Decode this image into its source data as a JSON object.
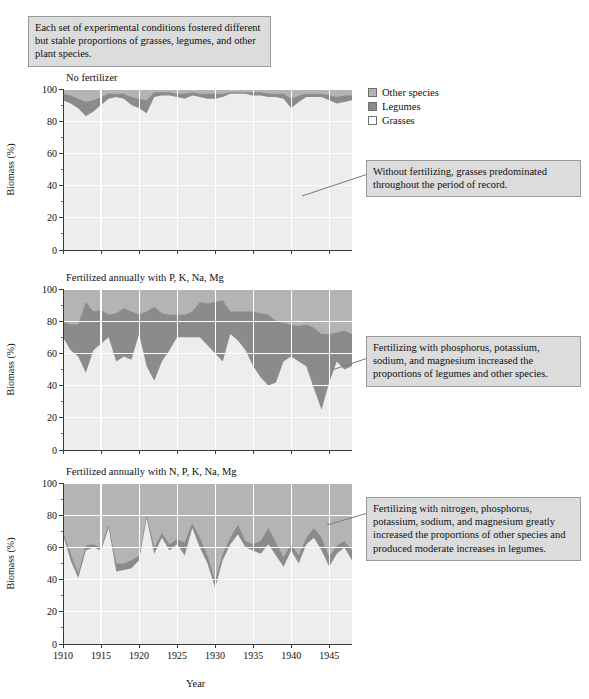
{
  "figure": {
    "axis_x_label": "Year",
    "axis_y_label": "Biomass (%)"
  },
  "legend": {
    "position": "top-right",
    "items": [
      {
        "label": "Other species",
        "color": "#b4b4b4",
        "key": "other"
      },
      {
        "label": "Legumes",
        "color": "#8b8b8b",
        "key": "legumes"
      },
      {
        "label": "Grasses",
        "color": "#ededed",
        "key": "grasses"
      }
    ]
  },
  "callouts": {
    "top": "Each set of experimental conditions fostered different but stable proportions of grasses, legumes, and other plant species.",
    "chart1": "Without fertilizing, grasses predominated throughout the period of record.",
    "chart2": "Fertilizing with phosphorus, potassium, sodium, and magnesium increased the proportions of legumes and other species.",
    "chart3": "Fertilizing with nitrogen, phosphorus, potassium, sodium, and magnesium greatly increased the proportions of other species and produced moderate increases in legumes."
  },
  "chart_data": [
    {
      "type": "area",
      "stacked": true,
      "title": "No fertilizer",
      "xlabel": "Year",
      "ylabel": "Biomass (%)",
      "xlim": [
        1910,
        1948
      ],
      "ylim": [
        0,
        100
      ],
      "ytick_major": [
        0,
        20,
        40,
        60,
        80,
        100
      ],
      "ytick_minor_step": 10,
      "xtick_major": [
        1910,
        1915,
        1920,
        1925,
        1930,
        1935,
        1940,
        1945
      ],
      "grid": true,
      "legend_order": [
        "grasses",
        "legumes",
        "other"
      ],
      "x": [
        1910,
        1911,
        1912,
        1913,
        1914,
        1915,
        1916,
        1917,
        1918,
        1919,
        1920,
        1921,
        1922,
        1923,
        1924,
        1925,
        1926,
        1927,
        1928,
        1929,
        1930,
        1931,
        1932,
        1933,
        1934,
        1935,
        1936,
        1937,
        1938,
        1939,
        1940,
        1941,
        1942,
        1943,
        1944,
        1945,
        1946,
        1947,
        1948
      ],
      "series": [
        {
          "name": "Grasses",
          "key": "grasses",
          "color": "#ededed",
          "values": [
            93,
            91,
            88,
            83,
            86,
            90,
            94,
            95,
            94,
            90,
            88,
            85,
            95,
            96,
            96,
            95,
            94,
            96,
            95,
            94,
            94,
            95,
            97,
            97,
            97,
            96,
            96,
            95,
            95,
            94,
            88,
            92,
            95,
            95,
            95,
            93,
            91,
            92,
            93
          ]
        },
        {
          "name": "Legumes",
          "key": "legumes",
          "color": "#8b8b8b",
          "values": [
            4,
            5,
            6,
            9,
            7,
            5,
            3,
            2,
            3,
            5,
            6,
            8,
            3,
            2,
            2,
            2,
            3,
            2,
            2,
            3,
            3,
            2,
            1,
            1,
            1,
            2,
            2,
            2,
            2,
            3,
            6,
            4,
            2,
            2,
            2,
            3,
            4,
            4,
            3
          ]
        },
        {
          "name": "Other species",
          "key": "other",
          "color": "#b4b4b4",
          "values": [
            3,
            4,
            6,
            8,
            7,
            5,
            3,
            3,
            3,
            5,
            6,
            7,
            2,
            2,
            2,
            3,
            3,
            2,
            3,
            3,
            3,
            3,
            2,
            2,
            2,
            2,
            2,
            3,
            3,
            3,
            6,
            4,
            3,
            3,
            3,
            4,
            5,
            4,
            4
          ]
        }
      ]
    },
    {
      "type": "area",
      "stacked": true,
      "title": "Fertilized annually with P, K, Na, Mg",
      "xlabel": "Year",
      "ylabel": "Biomass (%)",
      "xlim": [
        1910,
        1948
      ],
      "ylim": [
        0,
        100
      ],
      "ytick_major": [
        0,
        20,
        40,
        60,
        80,
        100
      ],
      "ytick_minor_step": 10,
      "xtick_major": [
        1910,
        1915,
        1920,
        1925,
        1930,
        1935,
        1940,
        1945
      ],
      "grid": true,
      "legend_order": [
        "grasses",
        "legumes",
        "other"
      ],
      "x": [
        1910,
        1911,
        1912,
        1913,
        1914,
        1915,
        1916,
        1917,
        1918,
        1919,
        1920,
        1921,
        1922,
        1923,
        1924,
        1925,
        1926,
        1927,
        1928,
        1929,
        1930,
        1931,
        1932,
        1933,
        1934,
        1935,
        1936,
        1937,
        1938,
        1939,
        1940,
        1941,
        1942,
        1943,
        1944,
        1945,
        1946,
        1947,
        1948
      ],
      "series": [
        {
          "name": "Grasses",
          "key": "grasses",
          "color": "#ededed",
          "values": [
            70,
            62,
            58,
            48,
            62,
            66,
            70,
            55,
            58,
            56,
            72,
            52,
            43,
            55,
            62,
            70,
            70,
            70,
            70,
            65,
            60,
            55,
            72,
            68,
            62,
            52,
            45,
            40,
            42,
            55,
            58,
            55,
            52,
            38,
            25,
            42,
            55,
            50,
            52
          ]
        },
        {
          "name": "Legumes",
          "key": "legumes",
          "color": "#8b8b8b",
          "values": [
            10,
            16,
            20,
            44,
            24,
            21,
            14,
            30,
            30,
            30,
            12,
            34,
            46,
            30,
            22,
            14,
            14,
            16,
            22,
            26,
            32,
            38,
            14,
            18,
            24,
            34,
            40,
            44,
            38,
            24,
            20,
            22,
            26,
            38,
            47,
            30,
            18,
            24,
            20
          ]
        },
        {
          "name": "Other species",
          "key": "other",
          "color": "#b4b4b4",
          "values": [
            20,
            22,
            22,
            8,
            14,
            13,
            16,
            15,
            12,
            14,
            16,
            14,
            11,
            15,
            16,
            16,
            16,
            14,
            8,
            9,
            8,
            7,
            14,
            14,
            14,
            14,
            15,
            16,
            20,
            21,
            22,
            23,
            22,
            24,
            28,
            28,
            27,
            26,
            28
          ]
        }
      ]
    },
    {
      "type": "area",
      "stacked": true,
      "title": "Fertilized annually with N, P, K, Na, Mg",
      "xlabel": "Year",
      "ylabel": "Biomass (%)",
      "xlim": [
        1910,
        1948
      ],
      "ylim": [
        0,
        100
      ],
      "ytick_major": [
        0,
        20,
        40,
        60,
        80,
        100
      ],
      "ytick_minor_step": 10,
      "xtick_major": [
        1910,
        1915,
        1920,
        1925,
        1930,
        1935,
        1940,
        1945
      ],
      "grid": true,
      "legend_order": [
        "grasses",
        "legumes",
        "other"
      ],
      "x": [
        1910,
        1911,
        1912,
        1913,
        1914,
        1915,
        1916,
        1917,
        1918,
        1919,
        1920,
        1921,
        1922,
        1923,
        1924,
        1925,
        1926,
        1927,
        1928,
        1929,
        1930,
        1931,
        1932,
        1933,
        1934,
        1935,
        1936,
        1937,
        1938,
        1939,
        1940,
        1941,
        1942,
        1943,
        1944,
        1945,
        1946,
        1947,
        1948
      ],
      "series": [
        {
          "name": "Grasses",
          "key": "grasses",
          "color": "#ededed",
          "values": [
            68,
            52,
            41,
            58,
            60,
            58,
            72,
            45,
            46,
            47,
            52,
            78,
            56,
            66,
            58,
            62,
            55,
            72,
            60,
            50,
            35,
            52,
            62,
            68,
            60,
            58,
            56,
            62,
            55,
            48,
            58,
            50,
            62,
            66,
            58,
            48,
            56,
            60,
            52
          ]
        },
        {
          "name": "Legumes",
          "key": "legumes",
          "color": "#8b8b8b",
          "values": [
            2,
            4,
            3,
            3,
            2,
            2,
            2,
            5,
            4,
            5,
            3,
            2,
            4,
            3,
            4,
            3,
            8,
            3,
            6,
            5,
            4,
            4,
            4,
            6,
            4,
            4,
            8,
            10,
            8,
            6,
            4,
            5,
            4,
            6,
            8,
            6,
            5,
            4,
            6
          ]
        },
        {
          "name": "Other species",
          "key": "other",
          "color": "#b4b4b4",
          "values": [
            30,
            44,
            56,
            39,
            38,
            40,
            26,
            50,
            50,
            48,
            45,
            20,
            40,
            31,
            38,
            35,
            37,
            25,
            34,
            45,
            61,
            44,
            34,
            26,
            36,
            38,
            36,
            28,
            37,
            46,
            38,
            45,
            34,
            28,
            34,
            46,
            39,
            36,
            42
          ]
        }
      ]
    }
  ]
}
